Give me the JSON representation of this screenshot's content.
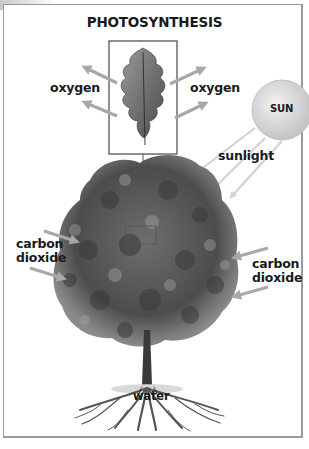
{
  "diagram": {
    "title": "PHOTOSYNTHESIS",
    "labels": {
      "oxygen_left": "oxygen",
      "oxygen_right": "oxygen",
      "sun": "SUN",
      "sunlight": "sunlight",
      "carbon_dioxide_left": [
        "carbon",
        "dioxide"
      ],
      "carbon_dioxide_right": [
        "carbon",
        "dioxide"
      ],
      "water": "water"
    },
    "elements": [
      "oak-leaf-inset",
      "sun",
      "sunlight-rays",
      "tree-canopy",
      "trunk",
      "roots",
      "arrows"
    ],
    "colors": {
      "arrow": "#a8a8a8",
      "sunlight_ray": "#d2d2d2",
      "sun_fill": "#dcdcdc",
      "text": "#1a1a1a",
      "frame": "#9a9a9a"
    }
  }
}
